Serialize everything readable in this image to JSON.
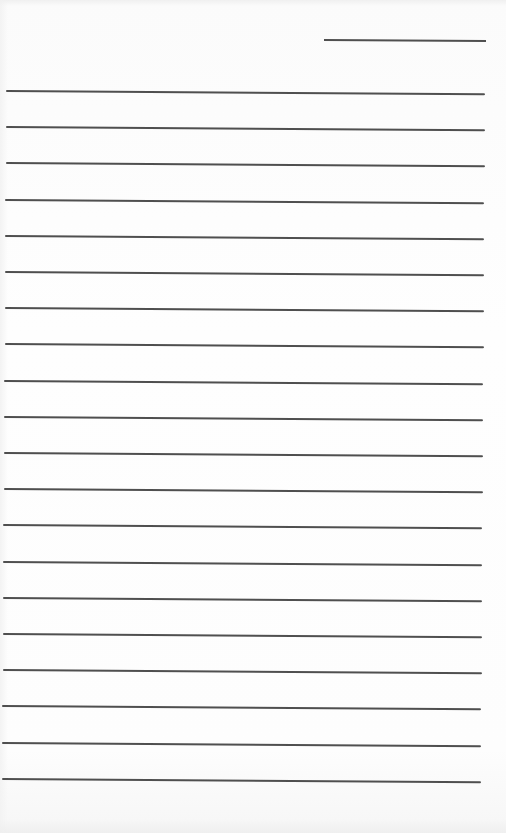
{
  "document": {
    "type": "lined-writing-sheet",
    "background_color": "#fdfdfd",
    "line_color": "#4f4f4f",
    "header_line": {
      "left": 324,
      "top": 39,
      "width": 162,
      "angle_deg": 0.35
    },
    "ruled_lines": {
      "count": 20,
      "first_top": 90,
      "spacing": 36.2,
      "left_start": 6,
      "left_end": 2,
      "right_start": 485,
      "right_end": 481,
      "angle_deg": 0.4
    }
  }
}
